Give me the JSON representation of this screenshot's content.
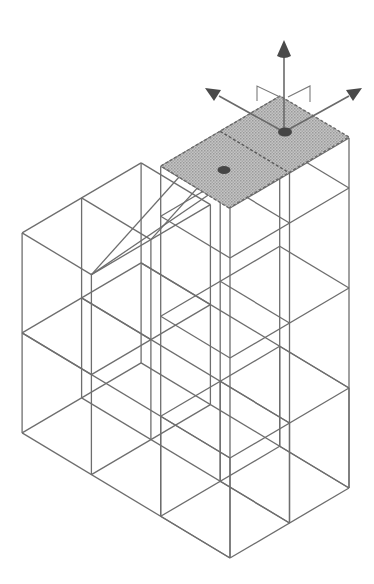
{
  "diagram": {
    "type": "isometric-wireframe",
    "colors": {
      "background": "#ffffff",
      "edge": "#6e6e6e",
      "selected_face_fill": "#b8b8b8",
      "gizmo": "#4a4a4a"
    },
    "projection": {
      "origin": [
        230,
        558
      ],
      "u": [
        59.5,
        -35
      ],
      "v": [
        -69.3,
        -41.7
      ],
      "h": [
        0,
        -100
      ]
    },
    "blocks": [
      {
        "name": "base-level",
        "u": [
          0,
          2
        ],
        "v": [
          0,
          3
        ],
        "h": [
          0,
          1
        ]
      },
      {
        "name": "left-block",
        "u": [
          0,
          2
        ],
        "v": [
          2,
          3
        ],
        "h": [
          1,
          2
        ]
      },
      {
        "name": "tower",
        "u": [
          0,
          2
        ],
        "v": [
          0,
          1
        ],
        "h": [
          0,
          3.5
        ]
      }
    ],
    "selected_face": {
      "name": "tower-top-face",
      "h": 3.5,
      "handles": 2
    },
    "gizmo": {
      "axes": [
        "up",
        "left",
        "right"
      ],
      "center": [
        284,
        132
      ]
    }
  }
}
